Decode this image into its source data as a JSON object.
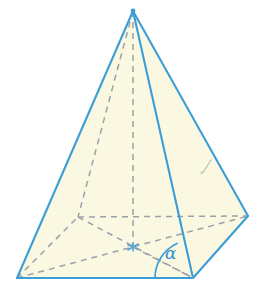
{
  "figure": {
    "name": "square-pyramid-with-base-angle",
    "labels": {
      "angle_alpha": "α"
    },
    "colors": {
      "edge_blue": "#3b9ed8",
      "edge_blue_dark": "#2f8fca",
      "face_fill": "#fbf8e2",
      "face_fill_light": "#fdfcf0",
      "hidden_line_gray": "#9aa0a8",
      "center_mark_blue": "#4aa8dd",
      "pencil_mark_gray": "#b9b9ae",
      "background": "#ffffff",
      "label_color": "#2f93cf"
    },
    "geometry": {
      "apex": [
        133,
        11
      ],
      "base_back_left": [
        78,
        217
      ],
      "base_right": [
        248,
        216
      ],
      "base_front": [
        193,
        278
      ],
      "base_bottom_left": [
        17,
        278
      ],
      "base_center": [
        133,
        247
      ],
      "angle_arc_center": [
        193,
        278
      ],
      "angle_arc_radius": 38,
      "angle_label_position": [
        165,
        245
      ]
    },
    "elements": {
      "left_face": "apex-bottomleft-front",
      "right_face": "apex-front-right",
      "back_left_face_hidden": "apex-bottomleft-backleft",
      "back_right_face_hidden": "apex-backleft-right",
      "base_square": "bottomleft-backleft-right-front",
      "axis": "apex-center",
      "diagonal_1": "bottomleft-right",
      "diagonal_2": "backleft-front",
      "apothem_line": "center-front",
      "pencil_tick": "small hook mark on right face"
    }
  }
}
